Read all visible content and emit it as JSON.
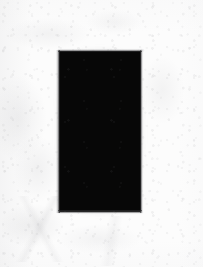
{
  "figure": {
    "title": "Black rectangle on textured paper",
    "medium": "scanned paper reproduction",
    "canvas": {
      "width_px": 203,
      "height_px": 267,
      "background_color": "#fcfcfc",
      "background_description": "near-white mottled paper texture with faint gray speckles and smudges"
    },
    "shape": {
      "name": "black rectangle",
      "type": "rectangle",
      "fill_color": "#070707",
      "edge_color": "#3c3c3e",
      "x_px": 59,
      "y_px": 51,
      "width_px": 82,
      "height_px": 161,
      "right_px": 141,
      "bottom_px": 212,
      "edge_quality": "soft anti-aliased gray transition band"
    },
    "margins": {
      "left_px": 59,
      "top_px": 51,
      "right_px": 62,
      "bottom_px": 55
    },
    "text_content": "none"
  }
}
